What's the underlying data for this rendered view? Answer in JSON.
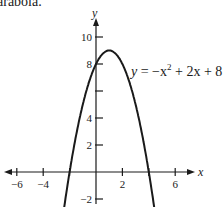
{
  "caption": "parabola.",
  "chart_data": {
    "type": "line",
    "title": "",
    "equation": "y = -x^2 + 2x + 8",
    "equation_label": {
      "y": "y",
      "eq": " = −x",
      "exp": "2",
      "rest": " + 2x + 8"
    },
    "xlabel": "x",
    "ylabel": "y",
    "xlim": [
      -7,
      7
    ],
    "ylim": [
      -2.5,
      11
    ],
    "x_ticks": [
      -6,
      -4,
      -2,
      2,
      4,
      6
    ],
    "x_tick_labels": [
      "-6",
      "-4",
      "2",
      "6"
    ],
    "y_ticks": [
      -2,
      2,
      4,
      6,
      8,
      10
    ],
    "y_tick_labels": [
      "-2",
      "2",
      "4",
      "8",
      "10"
    ],
    "x": [
      -2.6,
      -2,
      -1,
      0,
      1,
      2,
      3,
      4,
      4.6
    ],
    "y": [
      -4.0,
      0,
      5,
      8,
      9,
      8,
      5,
      0,
      -4.0
    ],
    "vertex": [
      1,
      9
    ],
    "roots": [
      -2,
      4
    ],
    "y_intercept": 8,
    "grid": false,
    "legend": "none"
  }
}
